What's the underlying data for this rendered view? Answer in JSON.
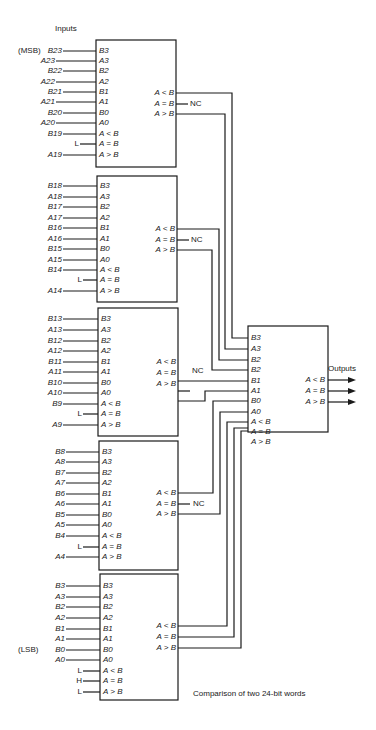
{
  "title_label": "Inputs",
  "outputs_label": "Outputs",
  "caption": "Comparison of two 24-bit words",
  "nc_label": "NC",
  "pin_labels_left": [
    "B3",
    "A3",
    "B2",
    "A2",
    "B1",
    "A1",
    "B0",
    "A0",
    "A < B",
    "A = B",
    "A > B"
  ],
  "pin_labels_right": [
    "A < B",
    "A = B",
    "A > B"
  ],
  "output_box_pins": [
    "B3",
    "A3",
    "B2",
    "B2",
    "B1",
    "A1",
    "B0",
    "A0",
    "A < B",
    "A = B",
    "A > B"
  ],
  "stages": [
    {
      "inputs": [
        "B23",
        "A23",
        "B22",
        "A22",
        "B21",
        "A21",
        "B20",
        "A20",
        "B19",
        "L",
        "A19"
      ],
      "prefix": "(MSB)"
    },
    {
      "inputs": [
        "B18",
        "A18",
        "B17",
        "A17",
        "B16",
        "A16",
        "B15",
        "A15",
        "B14",
        "L",
        "A14"
      ]
    },
    {
      "inputs": [
        "B13",
        "A13",
        "B12",
        "A12",
        "B11",
        "A11",
        "B10",
        "A10",
        "B9",
        "L",
        "A9"
      ]
    },
    {
      "inputs": [
        "B8",
        "A8",
        "B7",
        "A7",
        "B6",
        "A6",
        "B5",
        "A5",
        "B4",
        "L",
        "A4"
      ]
    },
    {
      "inputs": [
        "B3",
        "A3",
        "B2",
        "A2",
        "B1",
        "A1",
        "B0",
        "A0",
        "L",
        "H",
        "L"
      ],
      "prefix": "(LSB)"
    }
  ]
}
